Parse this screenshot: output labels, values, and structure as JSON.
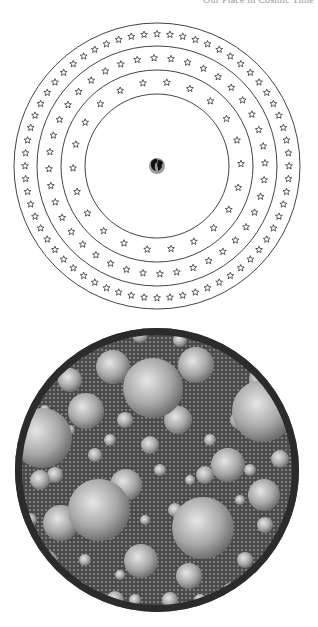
{
  "header": {
    "running_title": "Our Place in Cosmic Time"
  },
  "figure_top": {
    "description": "Concentric rings of stars around Earth",
    "center": [
      157,
      166
    ],
    "ring_radii": [
      143,
      120,
      96,
      72
    ],
    "star_bands": [
      {
        "radius": 132,
        "count": 64
      },
      {
        "radius": 108,
        "count": 40
      },
      {
        "radius": 84,
        "count": 22
      }
    ],
    "center_icon": "earth-globe-icon",
    "colors": {
      "line": "#444444",
      "star": "#333333",
      "earth": "#555555"
    }
  },
  "figure_bottom": {
    "description": "Circular field packed with spheres of varying sizes",
    "center": [
      157,
      470
    ],
    "radius": 142,
    "border_width": 7,
    "colors": {
      "border": "#2b2b2b",
      "background": "#4a4a4a",
      "sphere_light": "#e6e6e6",
      "sphere_dark": "#6a6a6a"
    },
    "spheres": [
      [
        153,
        388,
        30
      ],
      [
        263,
        411,
        31
      ],
      [
        42,
        438,
        30
      ],
      [
        99,
        510,
        31
      ],
      [
        203,
        528,
        31
      ],
      [
        86,
        411,
        18
      ],
      [
        113,
        367,
        17
      ],
      [
        196,
        365,
        18
      ],
      [
        61,
        523,
        18
      ],
      [
        228,
        465,
        17
      ],
      [
        126,
        485,
        16
      ],
      [
        264,
        495,
        16
      ],
      [
        141,
        561,
        17
      ],
      [
        189,
        576,
        13
      ],
      [
        46,
        562,
        12
      ],
      [
        178,
        420,
        14
      ],
      [
        262,
        380,
        13
      ],
      [
        70,
        380,
        12
      ],
      [
        228,
        335,
        11
      ],
      [
        95,
        340,
        10
      ],
      [
        280,
        459,
        9
      ],
      [
        240,
        420,
        10
      ],
      [
        280,
        570,
        9
      ],
      [
        40,
        480,
        10
      ],
      [
        30,
        600,
        9
      ],
      [
        205,
        475,
        9
      ],
      [
        150,
        445,
        9
      ],
      [
        125,
        420,
        8
      ],
      [
        220,
        520,
        8
      ],
      [
        115,
        600,
        9
      ],
      [
        245,
        560,
        8
      ],
      [
        170,
        600,
        8
      ],
      [
        80,
        590,
        8
      ],
      [
        55,
        475,
        8
      ],
      [
        265,
        525,
        8
      ],
      [
        300,
        510,
        6
      ],
      [
        95,
        455,
        7
      ],
      [
        175,
        510,
        7
      ],
      [
        230,
        590,
        7
      ],
      [
        140,
        335,
        8
      ],
      [
        180,
        340,
        7
      ],
      [
        260,
        345,
        7
      ],
      [
        60,
        350,
        6
      ],
      [
        30,
        520,
        7
      ],
      [
        286,
        535,
        6
      ],
      [
        210,
        440,
        6
      ],
      [
        160,
        470,
        6
      ],
      [
        110,
        440,
        6
      ],
      [
        85,
        560,
        6
      ],
      [
        200,
        600,
        6
      ],
      [
        135,
        600,
        6
      ],
      [
        250,
        470,
        6
      ],
      [
        70,
        430,
        5
      ],
      [
        240,
        500,
        5
      ],
      [
        190,
        480,
        5
      ],
      [
        145,
        520,
        5
      ],
      [
        110,
        535,
        5
      ],
      [
        45,
        410,
        5
      ],
      [
        275,
        430,
        5
      ],
      [
        120,
        575,
        5
      ]
    ]
  }
}
